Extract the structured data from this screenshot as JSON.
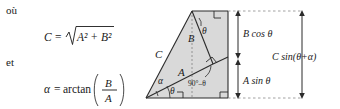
{
  "figure": {
    "language": "fr",
    "colors": {
      "fill": "#d9d9d9",
      "stroke": "#2b2b2b",
      "dashed": "#6b6b6b",
      "text": "#1a1a1a",
      "background": "#ffffff"
    },
    "text_block": {
      "where_label": "où",
      "formula_c_lhs": "C",
      "formula_c_eq": "=",
      "formula_c_radicand": "A² + B²",
      "and_label": "et",
      "formula_alpha_lhs": "α",
      "formula_alpha_eq": "=",
      "formula_alpha_fn": "arctan",
      "formula_alpha_num": "B",
      "formula_alpha_den": "A"
    },
    "diagram": {
      "side_label_c": "C",
      "side_label_a": "A",
      "side_label_b": "B",
      "angle_alpha": "α",
      "angle_theta_bottom": "θ",
      "angle_theta_top": "θ",
      "angle_complement": "90°–θ",
      "bracket_b_cos_theta": "B cos θ",
      "bracket_a_sin_theta": "A sin θ",
      "bracket_c_sin_sum": "C sin(θ+α)",
      "right_angle_markers": 5
    }
  }
}
